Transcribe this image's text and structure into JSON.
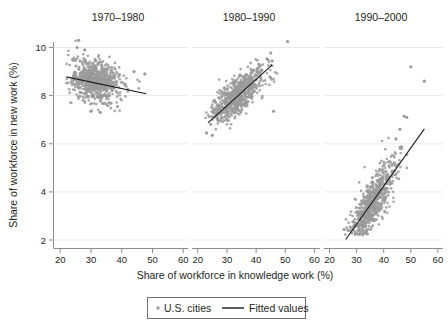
{
  "figure": {
    "background_color": "#ffffff",
    "point_color": "#9a9a9a",
    "line_color": "#1a1a1a",
    "grid_color": "#e3e3e3",
    "axis_color": "#8c8c8c"
  },
  "axis": {
    "x_title": "Share of workforce in knowledge work (%)",
    "y_title": "Share of workforce in new work (%)",
    "x_ticks": [
      "20",
      "30",
      "40",
      "50",
      "60"
    ],
    "y_ticks": [
      "2",
      "4",
      "6",
      "8",
      "10"
    ]
  },
  "legend": {
    "points_label": "U.S. cities",
    "line_label": "Fitted values"
  },
  "panels": [
    {
      "title": "1970–1980"
    },
    {
      "title": "1980–1990"
    },
    {
      "title": "1990–2000"
    }
  ],
  "chart_data": {
    "type": "scatter",
    "title": "",
    "subtitle": "",
    "xlabel": "Share of workforce in knowledge work (%)",
    "ylabel": "Share of workforce in new work (%)",
    "xlim": [
      18,
      62
    ],
    "ylim": [
      1.6,
      10.6
    ],
    "xticks": [
      20,
      30,
      40,
      50,
      60
    ],
    "yticks": [
      2,
      4,
      6,
      8,
      10
    ],
    "grid": "horizontal",
    "legend_position": "bottom-center",
    "legend_entries": [
      "U.S. cities",
      "Fitted values"
    ],
    "facets": [
      {
        "title": "1970–1980",
        "series": [
          {
            "name": "U.S. cities",
            "type": "scatter",
            "marker_color": "#9a9a9a",
            "n_points_approx": 700,
            "cluster": {
              "x_mean": 31.5,
              "x_sd": 4.2,
              "x_min": 22,
              "x_max": 48,
              "y_mean": 8.6,
              "y_sd": 0.45,
              "y_min": 7.3,
              "y_max": 10.3,
              "correlation": -0.18
            },
            "notable_points": [
              {
                "x": 26.0,
                "y": 10.3
              },
              {
                "x": 25.5,
                "y": 10.0
              },
              {
                "x": 28.0,
                "y": 9.9
              },
              {
                "x": 24.0,
                "y": 9.5
              },
              {
                "x": 44.0,
                "y": 9.0
              },
              {
                "x": 47.5,
                "y": 8.9
              },
              {
                "x": 42.0,
                "y": 8.25
              },
              {
                "x": 30.0,
                "y": 7.35
              },
              {
                "x": 33.0,
                "y": 7.3
              }
            ]
          },
          {
            "name": "Fitted values",
            "type": "line",
            "color": "#1a1a1a",
            "points": [
              [
                22.0,
                8.78
              ],
              [
                48.0,
                8.08
              ]
            ],
            "slope": -0.027,
            "intercept": 9.37
          }
        ]
      },
      {
        "title": "1980–1990",
        "series": [
          {
            "name": "U.S. cities",
            "type": "scatter",
            "marker_color": "#9a9a9a",
            "n_points_approx": 700,
            "cluster": {
              "x_mean": 33.5,
              "x_sd": 4.6,
              "x_min": 22,
              "x_max": 51,
              "y_mean": 8.0,
              "y_sd": 0.55,
              "y_min": 6.3,
              "y_max": 10.25,
              "correlation": 0.72
            },
            "notable_points": [
              {
                "x": 50.8,
                "y": 10.25
              },
              {
                "x": 44.0,
                "y": 9.5
              },
              {
                "x": 45.5,
                "y": 9.45
              },
              {
                "x": 41.0,
                "y": 9.3
              },
              {
                "x": 23.0,
                "y": 6.45
              },
              {
                "x": 25.0,
                "y": 6.35
              },
              {
                "x": 46.0,
                "y": 7.35
              }
            ]
          },
          {
            "name": "Fitted values",
            "type": "line",
            "color": "#1a1a1a",
            "points": [
              [
                23.5,
                6.87
              ],
              [
                45.5,
                9.28
              ]
            ],
            "slope": 0.11,
            "intercept": 4.29
          }
        ]
      },
      {
        "title": "1990–2000",
        "series": [
          {
            "name": "U.S. cities",
            "type": "scatter",
            "marker_color": "#9a9a9a",
            "n_points_approx": 700,
            "cluster": {
              "x_mean": 35.5,
              "x_sd": 4.5,
              "x_min": 25,
              "x_max": 50,
              "y_mean": 3.5,
              "y_sd": 0.9,
              "y_min": 2.2,
              "y_max": 7.2,
              "correlation": 0.82
            },
            "notable_points": [
              {
                "x": 50.0,
                "y": 9.2
              },
              {
                "x": 55.0,
                "y": 8.6
              },
              {
                "x": 47.5,
                "y": 7.15
              },
              {
                "x": 48.5,
                "y": 7.1
              },
              {
                "x": 46.0,
                "y": 6.6
              },
              {
                "x": 44.5,
                "y": 6.2
              },
              {
                "x": 32.5,
                "y": 2.3
              },
              {
                "x": 34.0,
                "y": 2.25
              }
            ]
          },
          {
            "name": "Fitted values",
            "type": "line",
            "color": "#1a1a1a",
            "points": [
              [
                26.0,
                2.02
              ],
              [
                55.0,
                6.62
              ]
            ],
            "slope": 0.159,
            "intercept": -2.1
          }
        ]
      }
    ]
  }
}
